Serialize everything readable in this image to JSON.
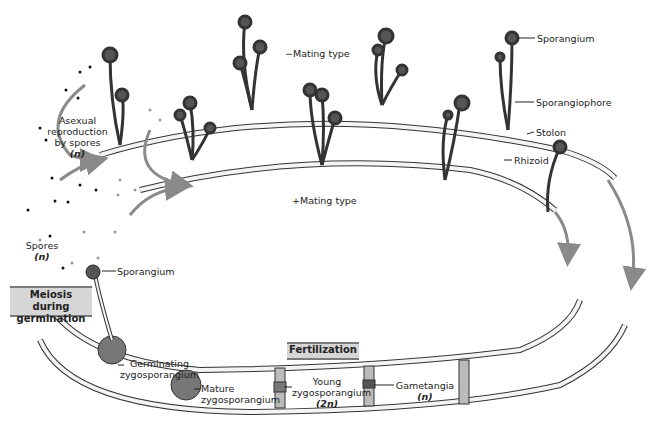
{
  "diagram": {
    "labels": {
      "asexual": {
        "line1": "Asexual",
        "line2": "reproduction",
        "line3": "by spores",
        "ploidy": "(n)"
      },
      "minus_mating": "−Mating type",
      "plus_mating": "+Mating type",
      "sporangium_top": "Sporangium",
      "sporangiophore": "Sporangiophore",
      "stolon": "Stolon",
      "rhizoid": "Rhizoid",
      "spores": {
        "line1": "Spores",
        "ploidy": "(n)"
      },
      "sporangium_left": "Sporangium",
      "germinating": {
        "line1": "Germinating",
        "line2": "zygosporangium"
      },
      "mature": {
        "line1": "Mature",
        "line2": "zygosporangium"
      },
      "young": {
        "line1": "Young",
        "line2": "zygosporangium",
        "ploidy": "(2n)"
      },
      "gametangia": {
        "line1": "Gametangia",
        "ploidy": "(n)"
      }
    },
    "stage_boxes": {
      "meiosis": {
        "line1": "Meiosis during",
        "line2": "germination"
      },
      "fertilization": "Fertilization"
    },
    "colors": {
      "outline": "#333333",
      "hypha_fill": "#f4f4f4",
      "sporangium": "#555555",
      "arrow": "#8a8a8a",
      "box_fill": "#d6d6d6",
      "box_border": "#7a7a7a",
      "zygo_fill": "#9a9a9a"
    }
  }
}
